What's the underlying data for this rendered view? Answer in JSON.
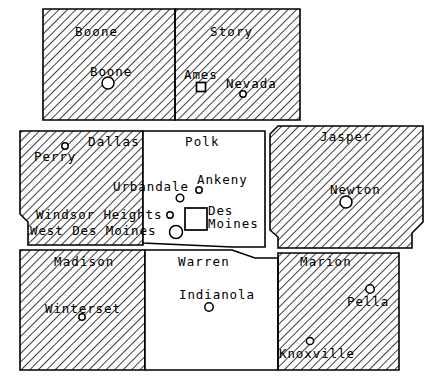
{
  "map": {
    "title": "Central Iowa Counties Map",
    "width": 443,
    "height": 380,
    "background_color": "#ffffff",
    "line_color": "#000000",
    "hatch_color": "#000000",
    "hatch_angle_degrees": 45,
    "hatch_spacing_px": 6
  },
  "counties": [
    {
      "id": "boone",
      "name": "Boone",
      "shaded": true,
      "label_x": 75,
      "label_y": 36,
      "outline": "M 43 9 L 175 9 L 175 120 L 43 120 Z"
    },
    {
      "id": "story",
      "name": "Story",
      "shaded": true,
      "label_x": 210,
      "label_y": 36,
      "outline": "M 175 9 L 300 9 L 300 120 L 175 120 Z"
    },
    {
      "id": "dallas",
      "name": "Dallas",
      "shaded": true,
      "label_x": 88,
      "label_y": 146,
      "outline": "M 20 131 L 143 131 L 143 245 L 28 245 L 28 222 L 20 214 Z"
    },
    {
      "id": "polk",
      "name": "Polk",
      "shaded": false,
      "label_x": 185,
      "label_y": 146,
      "outline": "M 143 131 L 265 131 L 265 247 L 232 247 L 143 243 Z"
    },
    {
      "id": "jasper",
      "name": "Jasper",
      "shaded": true,
      "label_x": 320,
      "label_y": 141,
      "outline": "M 278 126 L 423 126 L 423 222 L 412 233 L 412 248 L 278 248 L 278 237 L 270 230 L 270 134 Z"
    },
    {
      "id": "madison",
      "name": "Madison",
      "shaded": true,
      "label_x": 54,
      "label_y": 266,
      "outline": "M 20 250 L 145 250 L 145 370 L 20 370 Z"
    },
    {
      "id": "warren",
      "name": "Warren",
      "shaded": false,
      "label_x": 178,
      "label_y": 266,
      "outline": "M 145 250 L 232 250 L 255 258 L 278 258 L 278 370 L 145 370 Z"
    },
    {
      "id": "marion",
      "name": "Marion",
      "shaded": true,
      "label_x": 300,
      "label_y": 266,
      "outline": "M 278 253 L 399 253 L 399 370 L 278 370 Z"
    }
  ],
  "cities": [
    {
      "id": "boone-city",
      "name": "Boone",
      "marker": "circle",
      "marker_size": 6,
      "marker_x": 108,
      "marker_y": 83,
      "label_x": 90,
      "label_y": 76,
      "label_anchor": "start"
    },
    {
      "id": "ames",
      "name": "Ames",
      "marker": "square",
      "marker_size": 9,
      "marker_x": 201,
      "marker_y": 87,
      "label_x": 184,
      "label_y": 79,
      "label_anchor": "start"
    },
    {
      "id": "nevada",
      "name": "Nevada",
      "marker": "circle",
      "marker_size": 3.2,
      "marker_x": 243,
      "marker_y": 94,
      "label_x": 226,
      "label_y": 88,
      "label_anchor": "start"
    },
    {
      "id": "perry",
      "name": "Perry",
      "marker": "circle",
      "marker_size": 3.2,
      "marker_x": 65,
      "marker_y": 146,
      "label_x": 34,
      "label_y": 161,
      "label_anchor": "start"
    },
    {
      "id": "urbandale",
      "name": "Urbandale",
      "marker": "circle",
      "marker_size": 3.8,
      "marker_x": 180,
      "marker_y": 198,
      "label_x": 113,
      "label_y": 191,
      "label_anchor": "start"
    },
    {
      "id": "ankeny",
      "name": "Ankeny",
      "marker": "circle",
      "marker_size": 3.2,
      "marker_x": 199,
      "marker_y": 190,
      "label_x": 197,
      "label_y": 184,
      "label_anchor": "start"
    },
    {
      "id": "windsor-heights",
      "name": "Windsor Heights",
      "marker": "circle",
      "marker_size": 3.2,
      "marker_x": 170,
      "marker_y": 215,
      "label_x": 36,
      "label_y": 219,
      "label_anchor": "start"
    },
    {
      "id": "west-des-moines",
      "name": "West Des Moines",
      "marker": "circle",
      "marker_size": 6.5,
      "marker_x": 176,
      "marker_y": 232,
      "label_x": 30,
      "label_y": 235,
      "label_anchor": "start"
    },
    {
      "id": "des-moines",
      "name": "Des Moines",
      "marker": "square",
      "marker_size": 22,
      "marker_x": 196,
      "marker_y": 219,
      "label_line1": "Des",
      "label_line2": "Moines",
      "label_x": 208,
      "label_y": 215,
      "label_anchor": "start"
    },
    {
      "id": "newton",
      "name": "Newton",
      "marker": "circle",
      "marker_size": 6,
      "marker_x": 346,
      "marker_y": 202,
      "label_x": 330,
      "label_y": 194,
      "label_anchor": "start"
    },
    {
      "id": "winterset",
      "name": "Winterset",
      "marker": "circle",
      "marker_size": 3.2,
      "marker_x": 82,
      "marker_y": 317,
      "label_x": 45,
      "label_y": 313,
      "label_anchor": "start"
    },
    {
      "id": "indianola",
      "name": "Indianola",
      "marker": "circle",
      "marker_size": 4.2,
      "marker_x": 209,
      "marker_y": 307,
      "label_x": 179,
      "label_y": 299,
      "label_anchor": "start"
    },
    {
      "id": "pella",
      "name": "Pella",
      "marker": "circle",
      "marker_size": 4.2,
      "marker_x": 370,
      "marker_y": 289,
      "label_x": 347,
      "label_y": 306,
      "label_anchor": "start"
    },
    {
      "id": "knoxville",
      "name": "Knoxville",
      "marker": "circle",
      "marker_size": 3.6,
      "marker_x": 310,
      "marker_y": 341,
      "label_x": 279,
      "label_y": 358,
      "label_anchor": "start"
    }
  ]
}
